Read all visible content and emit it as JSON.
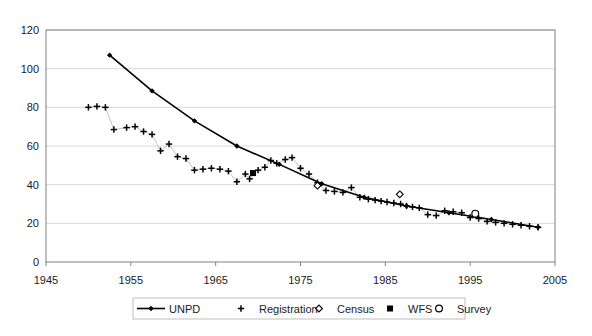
{
  "chart_data": {
    "type": "scatter",
    "title": "",
    "xlabel": "",
    "ylabel": "",
    "xlim": [
      1945,
      2005
    ],
    "ylim": [
      0,
      120
    ],
    "xticks": [
      1945,
      1955,
      1965,
      1975,
      1985,
      1995,
      2005
    ],
    "yticks": [
      0,
      20,
      40,
      60,
      80,
      100,
      120
    ],
    "grid": "horizontal",
    "legend_position": "bottom",
    "colors": {
      "series": "#000000",
      "grid": "#d9d9d9",
      "frame": "#808080",
      "background": "#ffffff"
    },
    "series": [
      {
        "name": "UNPD",
        "marker": "filled-diamond",
        "line": true,
        "points": [
          [
            1952.5,
            107.0
          ],
          [
            1957.5,
            88.5
          ],
          [
            1962.5,
            73.0
          ],
          [
            1967.5,
            60.0
          ],
          [
            1972.5,
            50.5
          ],
          [
            1977.5,
            40.5
          ],
          [
            1982.5,
            33.5
          ],
          [
            1987.5,
            29.0
          ],
          [
            1992.5,
            25.5
          ],
          [
            1997.5,
            22.0
          ],
          [
            2003.0,
            18.0
          ]
        ]
      },
      {
        "name": "Registration",
        "marker": "plus",
        "line": false,
        "points": [
          [
            1950.0,
            80.0
          ],
          [
            1951.0,
            80.5
          ],
          [
            1952.0,
            80.0
          ],
          [
            1953.0,
            68.5
          ],
          [
            1954.5,
            69.5
          ],
          [
            1955.5,
            70.0
          ],
          [
            1956.5,
            67.5
          ],
          [
            1957.5,
            66.0
          ],
          [
            1958.5,
            57.5
          ],
          [
            1959.5,
            61.0
          ],
          [
            1960.5,
            54.5
          ],
          [
            1961.5,
            53.5
          ],
          [
            1962.5,
            47.5
          ],
          [
            1963.5,
            48.0
          ],
          [
            1964.5,
            48.5
          ],
          [
            1965.5,
            48.0
          ],
          [
            1966.5,
            47.0
          ],
          [
            1967.5,
            41.5
          ],
          [
            1968.5,
            45.5
          ],
          [
            1969.0,
            43.0
          ],
          [
            1970.0,
            47.5
          ],
          [
            1970.8,
            49.0
          ],
          [
            1971.5,
            52.5
          ],
          [
            1972.2,
            51.0
          ],
          [
            1973.2,
            53.0
          ],
          [
            1974.0,
            54.0
          ],
          [
            1975.0,
            48.5
          ],
          [
            1976.0,
            45.5
          ],
          [
            1977.0,
            41.0
          ],
          [
            1978.0,
            37.0
          ],
          [
            1979.0,
            36.5
          ],
          [
            1980.0,
            36.0
          ],
          [
            1981.0,
            38.5
          ],
          [
            1982.0,
            33.5
          ],
          [
            1983.0,
            32.5
          ],
          [
            1983.8,
            32.0
          ],
          [
            1984.5,
            31.5
          ],
          [
            1985.2,
            31.0
          ],
          [
            1986.0,
            30.5
          ],
          [
            1986.8,
            30.0
          ],
          [
            1987.5,
            29.0
          ],
          [
            1988.2,
            28.5
          ],
          [
            1989.0,
            28.0
          ],
          [
            1990.0,
            24.5
          ],
          [
            1991.0,
            24.0
          ],
          [
            1992.0,
            26.5
          ],
          [
            1993.0,
            26.0
          ],
          [
            1994.0,
            25.5
          ],
          [
            1995.0,
            23.0
          ],
          [
            1996.0,
            22.5
          ],
          [
            1997.0,
            21.0
          ],
          [
            1998.0,
            20.5
          ],
          [
            1999.0,
            20.0
          ],
          [
            2000.0,
            19.5
          ],
          [
            2001.0,
            19.0
          ],
          [
            2002.0,
            18.5
          ],
          [
            2003.0,
            18.0
          ]
        ]
      },
      {
        "name": "Census",
        "marker": "open-diamond",
        "line": false,
        "points": [
          [
            1977.0,
            39.5
          ],
          [
            1986.7,
            35.0
          ]
        ]
      },
      {
        "name": "WFS",
        "marker": "filled-square",
        "line": false,
        "points": [
          [
            1969.4,
            46.0
          ]
        ]
      },
      {
        "name": "Survey",
        "marker": "open-circle",
        "line": false,
        "points": [
          [
            1995.6,
            25.0
          ]
        ]
      }
    ]
  },
  "legend": {
    "items": [
      {
        "label": "UNPD",
        "marker": "line-filled-diamond"
      },
      {
        "label": "Registration",
        "marker": "plus"
      },
      {
        "label": "Census",
        "marker": "open-diamond"
      },
      {
        "label": "WFS",
        "marker": "filled-square"
      },
      {
        "label": "Survey",
        "marker": "open-circle"
      }
    ]
  },
  "axes": {
    "y_tick_labels": [
      "0",
      "20",
      "40",
      "60",
      "80",
      "100",
      "120"
    ],
    "x_tick_labels": [
      "1945",
      "1955",
      "1965",
      "1975",
      "1985",
      "1995",
      "2005"
    ]
  }
}
